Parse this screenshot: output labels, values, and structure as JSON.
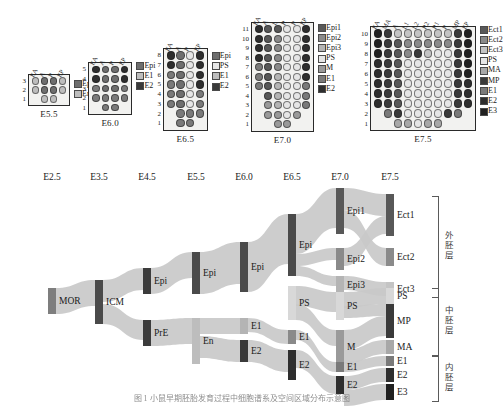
{
  "figure": {
    "caption": "图 1    小鼠早期胚胎发育过程中细胞谱系及空间区域分布示意图",
    "axis_stages": [
      "E2.5",
      "E3.5",
      "E4.5",
      "E5.5",
      "E6.0",
      "E6.5",
      "E7.0",
      "E7.5"
    ]
  },
  "colors": {
    "Epi": "#6e6e6e",
    "En": "#bdbdbd",
    "Epi1": "#585858",
    "Epi2": "#8a8a8a",
    "Epi3": "#b4b4b4",
    "PS": "#e6e6e6",
    "M": "#9a9a9a",
    "MA": "#a8a8a8",
    "MP": "#3a3a3a",
    "E1": "#7a7a7a",
    "E2": "#2e2e2e",
    "E3": "#202020",
    "Ect1": "#585858",
    "Ect2": "#8a8a8a",
    "Ect3": "#c4c4c4",
    "MOR": "#7e7e7e",
    "ICM": "#4a4a4a",
    "PrE": "#3c3c3c",
    "flow": "#c9c9c9",
    "grid_bg": "#f2f2f0",
    "border": "#2a2a2a"
  },
  "panels": [
    {
      "name": "E5.5",
      "stage_label": "E5.5",
      "rows": [
        "3",
        "2",
        "1"
      ],
      "cols": [
        "EA",
        "A",
        "P",
        "EP"
      ],
      "legend": [
        {
          "label": "Epi",
          "color": "#6e6e6e"
        },
        {
          "label": "En",
          "color": "#bdbdbd"
        }
      ],
      "cells": [
        [
          "En",
          "Epi",
          "Epi",
          "En"
        ],
        [
          "En",
          "Epi",
          "Epi",
          "En"
        ],
        [
          null,
          "En",
          "En",
          null
        ]
      ]
    },
    {
      "name": "E6.0",
      "stage_label": "E6.0",
      "rows": [
        "5",
        "4",
        "3",
        "2",
        "1"
      ],
      "cols": [
        "EA",
        "A",
        "P",
        "EP"
      ],
      "legend": [
        {
          "label": "Epi",
          "color": "#6e6e6e"
        },
        {
          "label": "E1",
          "color": "#bdbdbd"
        },
        {
          "label": "E2",
          "color": "#3a3a3a"
        }
      ],
      "cells": [
        [
          "E2",
          "Epi",
          "Epi",
          "E2"
        ],
        [
          "E2",
          "Epi",
          "Epi",
          "E2"
        ],
        [
          "E1",
          "Epi",
          "Epi",
          "E1"
        ],
        [
          "E1",
          "E1",
          "E1",
          "E1"
        ],
        [
          null,
          "E1",
          "E1",
          null
        ]
      ]
    },
    {
      "name": "E6.5",
      "stage_label": "E6.5",
      "rows": [
        "8",
        "7",
        "6",
        "5",
        "4",
        "3",
        "2",
        "1"
      ],
      "cols": [
        "EA",
        "A",
        "P",
        "EP"
      ],
      "legend": [
        {
          "label": "Epi",
          "color": "#6e6e6e"
        },
        {
          "label": "PS",
          "color": "#e6e6e6"
        },
        {
          "label": "E1",
          "color": "#bdbdbd"
        },
        {
          "label": "E2",
          "color": "#3a3a3a"
        }
      ],
      "cells": [
        [
          "E2",
          "Epi",
          "PS",
          "E2"
        ],
        [
          "E2",
          "Epi",
          "PS",
          "E2"
        ],
        [
          "E1",
          "Epi",
          "PS",
          "E2"
        ],
        [
          "E1",
          "Epi",
          "PS",
          "E2"
        ],
        [
          "E1",
          "Epi",
          "PS",
          "E1"
        ],
        [
          "E1",
          "Epi",
          "PS",
          "E1"
        ],
        [
          null,
          "E1",
          "E1",
          "E1"
        ],
        [
          null,
          "E1",
          "E1",
          null
        ]
      ]
    },
    {
      "name": "E7.0",
      "stage_label": "E7.0",
      "rows": [
        "11",
        "10",
        "9",
        "8",
        "7",
        "6",
        "5",
        "4",
        "3",
        "2",
        "1"
      ],
      "cols": [
        "EA",
        "A",
        "L",
        "R",
        "P",
        "EP"
      ],
      "legend": [
        {
          "label": "Epi1",
          "color": "#585858"
        },
        {
          "label": "Epi2",
          "color": "#8a8a8a"
        },
        {
          "label": "Epi3",
          "color": "#b4b4b4"
        },
        {
          "label": "PS",
          "color": "#e6e6e6"
        },
        {
          "label": "M",
          "color": "#9a9a9a"
        },
        {
          "label": "E1",
          "color": "#7a7a7a"
        },
        {
          "label": "E2",
          "color": "#2e2e2e"
        }
      ],
      "cells": [
        [
          "E2",
          "Epi1",
          "Epi1",
          "PS",
          "PS",
          "E2"
        ],
        [
          "E2",
          "Epi1",
          "Epi2",
          "PS",
          "PS",
          "E2"
        ],
        [
          "E2",
          "Epi1",
          "Epi2",
          "PS",
          "PS",
          "E2"
        ],
        [
          "E2",
          "Epi1",
          "Epi2",
          "PS",
          "PS",
          "E2"
        ],
        [
          "E1",
          "Epi1",
          "Epi2",
          "PS",
          "PS",
          "E2"
        ],
        [
          "E1",
          "Epi1",
          "Epi3",
          "PS",
          "PS",
          "E2"
        ],
        [
          "E1",
          "Epi1",
          "Epi3",
          "PS",
          "PS",
          "E1"
        ],
        [
          null,
          "Epi1",
          "Epi3",
          "PS",
          "PS",
          "E1"
        ],
        [
          null,
          "M",
          "Epi3",
          "PS",
          "PS",
          "E1"
        ],
        [
          null,
          "M",
          "M",
          "PS",
          "M",
          null
        ],
        [
          null,
          null,
          "M",
          "M",
          null,
          null
        ]
      ]
    },
    {
      "name": "E7.5",
      "stage_label": "E7.5",
      "rows": [
        "10",
        "9",
        "8",
        "7",
        "6",
        "5",
        "4",
        "3",
        "2",
        "1"
      ],
      "cols": [
        "EA",
        "MA",
        "A",
        "L1",
        "L2",
        "R2",
        "R1",
        "P",
        "MP",
        "EP"
      ],
      "legend": [
        {
          "label": "Ect1",
          "color": "#585858"
        },
        {
          "label": "Ect2",
          "color": "#8a8a8a"
        },
        {
          "label": "Ect3",
          "color": "#c4c4c4"
        },
        {
          "label": "PS",
          "color": "#e6e6e6"
        },
        {
          "label": "MA",
          "color": "#a8a8a8"
        },
        {
          "label": "MP",
          "color": "#3a3a3a"
        },
        {
          "label": "E1",
          "color": "#7a7a7a"
        },
        {
          "label": "E2",
          "color": "#2e2e2e"
        },
        {
          "label": "E3",
          "color": "#202020"
        }
      ],
      "cells": [
        [
          "E3",
          "MP",
          "Ect3",
          "Ect3",
          "Ect3",
          "Ect3",
          "Ect3",
          "Ect3",
          "MP",
          "E3"
        ],
        [
          "E3",
          "MP",
          "Ect1",
          "Ect2",
          "Ect2",
          "Ect2",
          "Ect2",
          "Ect2",
          "MP",
          "E3"
        ],
        [
          "E3",
          "MP",
          "Ect1",
          "Ect2",
          "MP",
          "Ect3",
          "PS",
          "PS",
          "MP",
          "E3"
        ],
        [
          "E2",
          "MP",
          "Ect1",
          "PS",
          "PS",
          "PS",
          "PS",
          "PS",
          "MP",
          "E3"
        ],
        [
          "E2",
          "MP",
          "Ect1",
          "PS",
          "PS",
          "PS",
          "PS",
          "PS",
          "MP",
          "E3"
        ],
        [
          "E2",
          "MP",
          "Ect1",
          "PS",
          "PS",
          "PS",
          "PS",
          "PS",
          "MP",
          "E2"
        ],
        [
          "E2",
          "MP",
          "Ect1",
          "PS",
          "PS",
          "PS",
          "PS",
          "PS",
          "MP",
          "E2"
        ],
        [
          "E2",
          "MP",
          "Ect1",
          "PS",
          "PS",
          "PS",
          "PS",
          "PS",
          "MP",
          "E2"
        ],
        [
          null,
          "E1",
          "MP",
          "PS",
          "PS",
          "PS",
          "PS",
          "MP",
          "E1",
          null
        ],
        [
          null,
          null,
          "MA",
          "MA",
          "PS",
          "MA",
          "MA",
          null,
          null,
          null
        ]
      ]
    }
  ],
  "sankey": {
    "nodes": [
      {
        "id": "MOR",
        "label": "MOR",
        "stage": "E2.5",
        "color": "#7e7e7e"
      },
      {
        "id": "ICM",
        "label": "ICM",
        "stage": "E3.5",
        "color": "#4a4a4a"
      },
      {
        "id": "Epi45",
        "label": "Epi",
        "stage": "E4.5",
        "color": "#3c3c3c"
      },
      {
        "id": "PrE45",
        "label": "PrE",
        "stage": "E4.5",
        "color": "#3c3c3c"
      },
      {
        "id": "Epi55",
        "label": "Epi",
        "stage": "E5.5",
        "color": "#4a4a4a"
      },
      {
        "id": "En55",
        "label": "En",
        "stage": "E5.5",
        "color": "#bdbdbd"
      },
      {
        "id": "Epi60",
        "label": "Epi",
        "stage": "E6.0",
        "color": "#4a4a4a"
      },
      {
        "id": "E160",
        "label": "E1",
        "stage": "E6.0",
        "color": "#b4b4b4"
      },
      {
        "id": "E260",
        "label": "E2",
        "stage": "E6.0",
        "color": "#3a3a3a"
      },
      {
        "id": "Epi65",
        "label": "Epi",
        "stage": "E6.5",
        "color": "#4a4a4a"
      },
      {
        "id": "PS65",
        "label": "PS",
        "stage": "E6.5",
        "color": "#d8d8d8"
      },
      {
        "id": "E165",
        "label": "E1",
        "stage": "E6.5",
        "color": "#8a8a8a"
      },
      {
        "id": "E265",
        "label": "E2",
        "stage": "E6.5",
        "color": "#2e2e2e"
      },
      {
        "id": "Epi1",
        "label": "Epi1",
        "stage": "E7.0",
        "color": "#585858"
      },
      {
        "id": "Epi2",
        "label": "Epi2",
        "stage": "E7.0",
        "color": "#8a8a8a"
      },
      {
        "id": "Epi3",
        "label": "Epi3",
        "stage": "E7.0",
        "color": "#b4b4b4"
      },
      {
        "id": "PS70",
        "label": "PS",
        "stage": "E7.0",
        "color": "#d8d8d8"
      },
      {
        "id": "M70",
        "label": "M",
        "stage": "E7.0",
        "color": "#9a9a9a"
      },
      {
        "id": "E170",
        "label": "E1",
        "stage": "E7.0",
        "color": "#7a7a7a"
      },
      {
        "id": "E270",
        "label": "E2",
        "stage": "E7.0",
        "color": "#2e2e2e"
      },
      {
        "id": "Ect1",
        "label": "Ect1",
        "stage": "E7.5",
        "color": "#585858"
      },
      {
        "id": "Ect2",
        "label": "Ect2",
        "stage": "E7.5",
        "color": "#8a8a8a"
      },
      {
        "id": "Ect3",
        "label": "Ect3",
        "stage": "E7.5",
        "color": "#c4c4c4"
      },
      {
        "id": "PS75",
        "label": "PS",
        "stage": "E7.5",
        "color": "#d8d8d8"
      },
      {
        "id": "MP75",
        "label": "MP",
        "stage": "E7.5",
        "color": "#3a3a3a"
      },
      {
        "id": "MA75",
        "label": "MA",
        "stage": "E7.5",
        "color": "#a8a8a8"
      },
      {
        "id": "E175",
        "label": "E1",
        "stage": "E7.5",
        "color": "#7a7a7a"
      },
      {
        "id": "E275",
        "label": "E2",
        "stage": "E7.5",
        "color": "#2e2e2e"
      },
      {
        "id": "E375",
        "label": "E3",
        "stage": "E7.5",
        "color": "#202020"
      }
    ],
    "germ_layers": [
      {
        "label": "外胚层",
        "members": [
          "Ect1",
          "Ect2",
          "Ect3"
        ]
      },
      {
        "label": "中胚层",
        "members": [
          "PS",
          "MP",
          "MA"
        ]
      },
      {
        "label": "内胚层",
        "members": [
          "E1",
          "E2",
          "E3"
        ]
      }
    ]
  }
}
